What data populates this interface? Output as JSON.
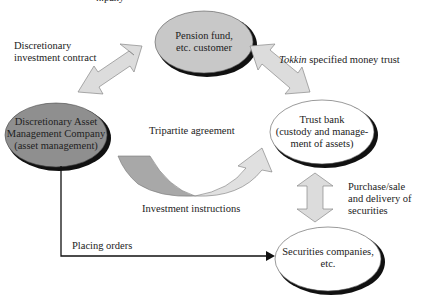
{
  "header_fragment": "...pany",
  "nodes": {
    "pension": {
      "line1": "Pension fund,",
      "line2": "etc. customer",
      "fill": "#c8c8c8"
    },
    "asset_mgmt": {
      "line1": "Discretionary Asset",
      "line2": "Management Company",
      "line3": "(asset management)",
      "fill": "#8f8f8f"
    },
    "trust_bank": {
      "line1": "Trust bank",
      "line2": "(custody and manage-",
      "line3": "ment of assets)",
      "fill": "#ffffff"
    },
    "securities": {
      "line1": "Securities companies,",
      "line2": "etc.",
      "fill": "#ffffff"
    }
  },
  "labels": {
    "discretionary_contract_1": "Discretionary",
    "discretionary_contract_2": "investment contract",
    "tokkin_italic": "Tokkin",
    "tokkin_rest": " specified money trust",
    "tripartite": "Tripartite agreement",
    "investment_instructions": "Investment instructions",
    "purchase_1": "Purchase/sale",
    "purchase_2": "and delivery of",
    "purchase_3": "securities",
    "placing_orders": "Placing orders"
  },
  "colors": {
    "arrow_fill": "#dcdcdc",
    "arrow_stroke": "#888888",
    "curve_dark": "#a8a8a8",
    "curve_light": "#e0e0e0",
    "shadow": "#111111"
  }
}
